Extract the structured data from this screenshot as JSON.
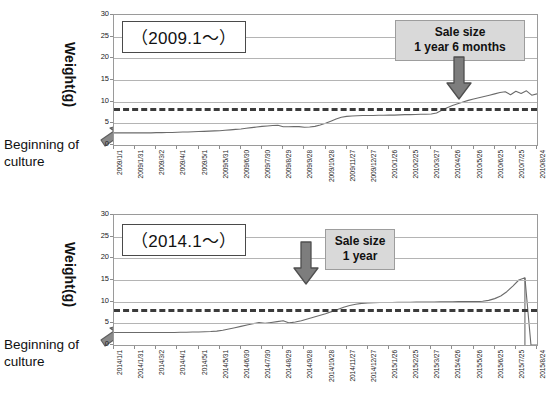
{
  "page": {
    "background": "#ffffff",
    "accent_gray": "#5a5a5a",
    "callout_bg": "#d9d9d9",
    "line_color": "#6b6b6b",
    "threshold_color": "#3b3b3b"
  },
  "charts": [
    {
      "id": "chart-top",
      "series_title": "（2009.1〜）",
      "ylabel": "Weight(g)",
      "origin_note": "Beginning of\nculture",
      "callout": {
        "line1": "Sale size",
        "line2": "1 year 6 months"
      },
      "chart_data": {
        "type": "line",
        "title": "（2009.1〜）",
        "xlabel": "",
        "ylabel": "Weight(g)",
        "ylim": [
          0,
          30
        ],
        "yticks": [
          0,
          5,
          10,
          15,
          20,
          25,
          30
        ],
        "grid": true,
        "legend": "none",
        "annotations": [
          {
            "text": "Sale size 1 year 6 months",
            "x": "2010/5/26",
            "y": 9.0,
            "kind": "arrow-callout"
          },
          {
            "text": "Beginning of culture",
            "x": "2009/1/1",
            "y": 0,
            "kind": "arrow"
          },
          {
            "text": "threshold",
            "y": 8.5,
            "kind": "dashed-horizontal-line"
          }
        ],
        "xticks": [
          "2009/1/1",
          "2009/1/31",
          "2009/3/2",
          "2009/4/1",
          "2009/5/1",
          "2009/5/31",
          "2009/6/30",
          "2009/7/30",
          "2009/8/29",
          "2009/9/28",
          "2009/10/28",
          "2009/11/27",
          "2009/12/27",
          "2010/1/26",
          "2010/2/25",
          "2010/3/27",
          "2010/4/26",
          "2010/5/26",
          "2010/6/25",
          "2010/7/25",
          "2010/8/24"
        ],
        "threshold_value": 8.5,
        "x": [
          0,
          1,
          2,
          3,
          4,
          5,
          6,
          7,
          8,
          9,
          10,
          11,
          12,
          13,
          14,
          15,
          16,
          17,
          18,
          19,
          20,
          21,
          22,
          23,
          24,
          25,
          26,
          27,
          28,
          29,
          30,
          31,
          32,
          33,
          34,
          35,
          36,
          37,
          38,
          39,
          40,
          41,
          42,
          43,
          44,
          45,
          46,
          47,
          48,
          49,
          50,
          51,
          52,
          53,
          54,
          55,
          56,
          57,
          58,
          59,
          60
        ],
        "values": [
          2.8,
          2.8,
          2.8,
          2.8,
          2.8,
          2.8,
          2.8,
          2.8,
          2.85,
          2.85,
          2.9,
          2.9,
          2.95,
          3.0,
          3.0,
          3.05,
          3.1,
          3.15,
          3.2,
          3.25,
          3.3,
          3.4,
          3.5,
          3.6,
          3.7,
          3.85,
          4.0,
          4.15,
          4.3,
          4.4,
          4.5,
          4.55,
          4.2,
          4.2,
          4.25,
          4.25,
          4.1,
          4.15,
          4.3,
          4.6,
          5.0,
          5.5,
          6.0,
          6.4,
          6.6,
          6.7,
          6.75,
          6.8,
          6.8,
          6.8,
          6.85,
          6.85,
          6.9,
          6.9,
          6.95,
          7.0,
          7.0,
          7.05,
          7.1,
          7.1,
          7.15
        ],
        "values_tail_note": "rise past threshold after 2010/5, sawtooth peak ~12.5, end ~11.8",
        "tail_x": [
          61,
          62,
          63,
          64,
          65,
          66,
          67,
          68,
          69,
          70,
          71,
          72,
          73,
          74,
          75,
          76,
          77,
          78,
          79,
          80
        ],
        "tail_values": [
          7.4,
          8.0,
          8.6,
          9.1,
          9.5,
          9.9,
          10.3,
          10.6,
          10.9,
          11.2,
          11.5,
          11.8,
          12.1,
          12.3,
          11.6,
          12.4,
          11.9,
          12.5,
          11.5,
          11.8
        ]
      }
    },
    {
      "id": "chart-bottom",
      "series_title": "（2014.1〜）",
      "ylabel": "Weight(g)",
      "origin_note": "Beginning of\nculture",
      "callout": {
        "line1": "Sale size",
        "line2": "1 year"
      },
      "chart_data": {
        "type": "line",
        "title": "（2014.1〜）",
        "xlabel": "",
        "ylabel": "Weight(g)",
        "ylim": [
          0,
          30
        ],
        "yticks": [
          0,
          5,
          10,
          15,
          20,
          25,
          30
        ],
        "grid": true,
        "legend": "none",
        "annotations": [
          {
            "text": "Sale size 1 year",
            "x": "2014/9/28",
            "y": 9.0,
            "kind": "arrow-callout"
          },
          {
            "text": "Beginning of culture",
            "x": "2014/1/1",
            "y": 0,
            "kind": "arrow"
          },
          {
            "text": "threshold",
            "y": 8.3,
            "kind": "dashed-horizontal-line"
          }
        ],
        "xticks": [
          "2014/1/1",
          "2014/1/31",
          "2014/3/2",
          "2014/4/1",
          "2014/5/1",
          "2014/5/31",
          "2014/6/30",
          "2014/7/30",
          "2014/8/29",
          "2014/9/28",
          "2014/10/28",
          "2014/11/27",
          "2014/12/27",
          "2015/1/26",
          "2015/2/25",
          "2015/3/27",
          "2015/4/26",
          "2015/5/26",
          "2015/6/25",
          "2015/7/25",
          "2015/8/24"
        ],
        "threshold_value": 8.3,
        "x": [
          0,
          1,
          2,
          3,
          4,
          5,
          6,
          7,
          8,
          9,
          10,
          11,
          12,
          13,
          14,
          15,
          16,
          17,
          18,
          19,
          20,
          21,
          22,
          23,
          24,
          25,
          26,
          27,
          28,
          29,
          30,
          31,
          32,
          33,
          34,
          35,
          36,
          37,
          38,
          39,
          40,
          41,
          42,
          43,
          44,
          45,
          46,
          47,
          48,
          49,
          50,
          51,
          52,
          53,
          54,
          55,
          56,
          57,
          58,
          59,
          60
        ],
        "values": [
          2.9,
          2.9,
          2.9,
          2.9,
          2.9,
          2.9,
          2.9,
          2.9,
          2.9,
          2.9,
          2.9,
          2.95,
          2.95,
          3.0,
          3.0,
          3.05,
          3.1,
          3.2,
          3.4,
          3.7,
          4.0,
          4.3,
          4.6,
          4.9,
          5.2,
          5.0,
          5.2,
          5.4,
          5.6,
          5.1,
          5.3,
          5.6,
          6.0,
          6.4,
          6.8,
          7.2,
          7.7,
          8.2,
          8.7,
          9.1,
          9.4,
          9.6,
          9.7,
          9.75,
          9.8,
          9.8,
          9.82,
          9.85,
          9.85,
          9.88,
          9.9,
          9.9,
          9.9,
          9.92,
          9.95,
          9.95,
          9.98,
          10.0,
          10.0,
          10.0,
          10.0
        ],
        "spike": {
          "x_label": "2015/5/26",
          "peak": 15.5,
          "drop_to": 0
        },
        "tail_x": [
          61,
          62,
          63,
          64,
          65,
          66,
          67,
          68,
          69,
          70
        ],
        "tail_values": [
          10.1,
          10.3,
          10.7,
          11.3,
          12.3,
          13.6,
          15.0,
          15.5,
          0,
          0
        ]
      }
    }
  ]
}
